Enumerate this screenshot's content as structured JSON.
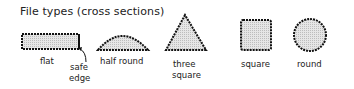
{
  "title": "File types (cross sections)",
  "labels": {
    "flat": "flat",
    "safe_edge_1": "safe",
    "safe_edge_2": "edge",
    "half_round": "half round",
    "three_square_1": "three",
    "three_square_2": "square",
    "square": "square",
    "round": "round"
  },
  "colors": {
    "fill": "#d8d8d8",
    "stroke": "#111111"
  }
}
